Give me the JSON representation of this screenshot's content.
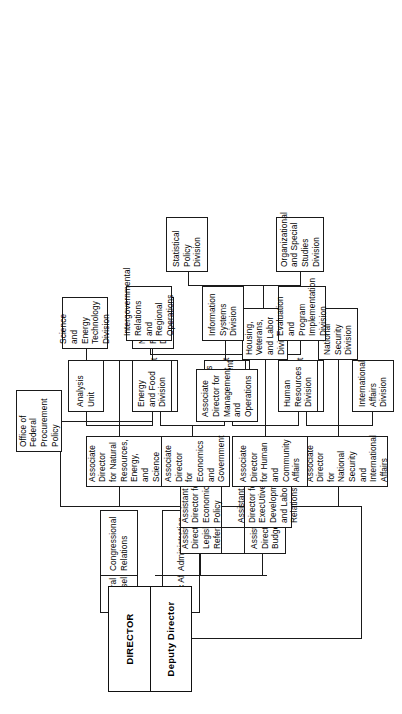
{
  "chart_title": "Office of Management and Budget Organization Chart",
  "orientation": "rotated-90-ccw",
  "colors": {
    "line": "#1a1a1a",
    "box_border": "#1a1a1a",
    "background": "#ffffff",
    "text": "#000000"
  },
  "head": {
    "director": "DIRECTOR",
    "deputy_director": "Deputy Director"
  },
  "staff_offices": {
    "public_affairs": "Public Affairs",
    "general_counsel": "General Counsel",
    "administration": "Administration",
    "congressional_relations": "Congressional Relations",
    "office_of_federal_procurement_policy": "Office of Federal Procurement Policy"
  },
  "assistant_directors": {
    "budget_review": "Assistant Director for Budget Review",
    "legislative_reference": "Assistant Director for Legislative Reference",
    "executive_development": "Assistant Director for ExecUtive Development and Labor Relations",
    "economic_policy": "Assistant Director for Economic Policy"
  },
  "associate_directors": [
    {
      "id": "national-security",
      "title": "Associate Director for National Security and International Affairs",
      "divisions": [
        "International Affairs Division",
        "Management Division",
        "National Security Division"
      ]
    },
    {
      "id": "human-community",
      "title": "Associate Director for Human and Community Affairs",
      "divisions": [
        "Human Resources Division",
        "Management Division",
        "Housing, Veterans, and Labor Division"
      ]
    },
    {
      "id": "economics-government",
      "title": "Associate Director for Economics and Government",
      "divisions": [
        "Economics and Government Division",
        "Management Division"
      ]
    },
    {
      "id": "natural-resources",
      "title": "Associate Director for Natural Resources, Energy, and Science",
      "divisions": [
        "Energy and Food Division",
        "Analysis Unit",
        "Natural Resources Division",
        "Science and Energy Technology Division"
      ]
    },
    {
      "id": "management-operations",
      "title": "Associate Director for Management and Operations",
      "divisions": [
        "Evaluation and Program Implementation Division",
        "Information Systems Division",
        "Intergovernmental Relations and Regional Operations",
        "Organizational and Special Studies Division",
        "Statistical Policy Division"
      ]
    }
  ]
}
